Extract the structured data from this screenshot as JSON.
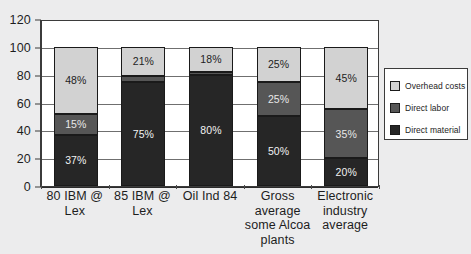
{
  "chart_data": {
    "type": "bar",
    "subtype": "stacked-column-100",
    "title": "",
    "xlabel": "",
    "ylabel": "",
    "ylim": [
      0,
      120
    ],
    "yticks": [
      0,
      20,
      40,
      60,
      80,
      100,
      120
    ],
    "ytick_labels": [
      "0",
      "20",
      "40",
      "60",
      "80",
      "100",
      "120"
    ],
    "grid": true,
    "grid_axis": "y",
    "legend_position": "right",
    "categories": [
      "80 IBM @ Lex",
      "85 IBM @ Lex",
      "Oil Ind 84",
      "Gross average some Alcoa plants",
      "Electronic industry average"
    ],
    "category_lines": [
      [
        "80 IBM @",
        "Lex"
      ],
      [
        "85 IBM @",
        "Lex"
      ],
      [
        "Oil Ind 84"
      ],
      [
        "Gross",
        "average",
        "some Alcoa",
        "plants"
      ],
      [
        "Electronic",
        "industry",
        "average"
      ]
    ],
    "series": [
      {
        "name": "Direct material",
        "color": "#262626",
        "values": [
          37,
          75,
          80,
          50,
          20
        ],
        "labels": [
          "37%",
          "75%",
          "80%",
          "50%",
          "20%"
        ]
      },
      {
        "name": "Direct labor",
        "color": "#565656",
        "values": [
          15,
          4,
          2,
          25,
          35
        ],
        "labels": [
          "15%",
          "",
          "",
          "25%",
          "35%"
        ]
      },
      {
        "name": "Overhead costs",
        "color": "#d2d2d2",
        "values": [
          48,
          21,
          18,
          25,
          45
        ],
        "labels": [
          "48%",
          "21%",
          "18%",
          "25%",
          "45%"
        ]
      }
    ],
    "stack_order_bottom_to_top": [
      "Direct material",
      "Direct labor",
      "Overhead costs"
    ],
    "legend": [
      {
        "label": "Overhead costs",
        "color": "#d2d2d2"
      },
      {
        "label": "Direct labor",
        "color": "#565656"
      },
      {
        "label": "Direct material",
        "color": "#262626"
      }
    ]
  }
}
